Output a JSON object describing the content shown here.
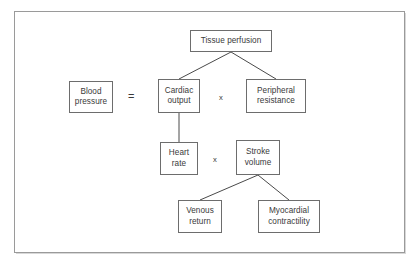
{
  "figure": {
    "kind": "hierarchical-equation-diagram",
    "frame": {
      "border_color": "#9a9a9a",
      "background": "#ffffff"
    },
    "node_style": {
      "border_color": "#6d6d6d",
      "text_color": "#3a3a3a",
      "fill": "#ffffff"
    },
    "connector_color": "#4a4a4a"
  },
  "nodes": {
    "tissue_perfusion": {
      "label": "Tissue perfusion",
      "x": 190,
      "y": 30,
      "w": 82,
      "h": 22
    },
    "blood_pressure": {
      "label": "Blood\npressure",
      "x": 69,
      "y": 81,
      "w": 44,
      "h": 32
    },
    "cardiac_output": {
      "label": "Cardiac\noutput",
      "x": 158,
      "y": 79,
      "w": 42,
      "h": 34
    },
    "peripheral_resistance": {
      "label": "Peripheral\nresistance",
      "x": 246,
      "y": 79,
      "w": 60,
      "h": 34
    },
    "heart_rate": {
      "label": "Heart\nrate",
      "x": 160,
      "y": 142,
      "w": 38,
      "h": 33
    },
    "stroke_volume": {
      "label": "Stroke\nvolume",
      "x": 236,
      "y": 140,
      "w": 44,
      "h": 35
    },
    "venous_return": {
      "label": "Venous\nreturn",
      "x": 178,
      "y": 200,
      "w": 44,
      "h": 33
    },
    "myocardial_contractility": {
      "label": "Myocardial\ncontractility",
      "x": 258,
      "y": 200,
      "w": 62,
      "h": 33
    }
  },
  "operators": {
    "equals": {
      "symbol": "=",
      "x": 128,
      "y": 91
    },
    "multiply_top": {
      "symbol": "x",
      "x": 219,
      "y": 93
    },
    "multiply_bottom": {
      "symbol": "x",
      "x": 213,
      "y": 155
    }
  },
  "connectors": [
    {
      "name": "tissue-perfusion-to-cardiac-output",
      "x1": 231,
      "y1": 52,
      "x2": 179,
      "y2": 79
    },
    {
      "name": "tissue-perfusion-to-peripheral-resistance",
      "x1": 231,
      "y1": 52,
      "x2": 276,
      "y2": 79
    },
    {
      "name": "cardiac-output-to-heart-rate",
      "x1": 179,
      "y1": 113,
      "x2": 179,
      "y2": 142
    },
    {
      "name": "stroke-volume-to-venous-return",
      "x1": 258,
      "y1": 175,
      "x2": 200,
      "y2": 200
    },
    {
      "name": "stroke-volume-to-myocardial-contractility",
      "x1": 258,
      "y1": 175,
      "x2": 289,
      "y2": 200
    }
  ]
}
